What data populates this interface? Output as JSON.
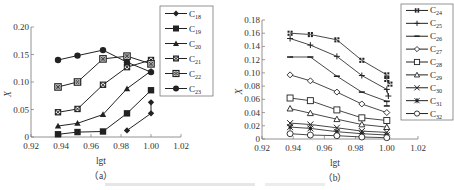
{
  "chart_data": [
    {
      "id": "a",
      "type": "line",
      "panel_label": "（a）",
      "xlabel": "lgt",
      "ylabel": "X",
      "xlim": [
        0.92,
        1.02
      ],
      "ylim": [
        0,
        0.2
      ],
      "xticks": [
        "0.92",
        "0.94",
        "0.96",
        "0.98",
        "1.00",
        "1.02"
      ],
      "yticks": [
        "0",
        "0.05",
        "0.10",
        "0.15",
        "0.20"
      ],
      "legend_position": "right",
      "series": [
        {
          "name": "C18",
          "base": "C",
          "sub": "18",
          "marker": "diamond-filled",
          "points": [
            [
              0.984,
              0.012
            ],
            [
              1.0,
              0.043
            ],
            [
              1.0,
              0.063
            ]
          ]
        },
        {
          "name": "C19",
          "base": "C",
          "sub": "19",
          "marker": "square-filled",
          "points": [
            [
              0.938,
              0.005
            ],
            [
              0.951,
              0.009
            ],
            [
              0.968,
              0.01
            ],
            [
              0.984,
              0.043
            ],
            [
              1.0,
              0.085
            ]
          ]
        },
        {
          "name": "C20",
          "base": "C",
          "sub": "20",
          "marker": "triangle-filled",
          "points": [
            [
              0.938,
              0.02
            ],
            [
              0.951,
              0.025
            ],
            [
              0.968,
              0.041
            ],
            [
              0.984,
              0.088
            ],
            [
              1.0,
              0.12
            ]
          ]
        },
        {
          "name": "C21",
          "base": "C",
          "sub": "21",
          "marker": "circle-cross",
          "points": [
            [
              0.938,
              0.045
            ],
            [
              0.951,
              0.051
            ],
            [
              0.968,
              0.095
            ],
            [
              0.984,
              0.127
            ],
            [
              1.0,
              0.14
            ]
          ]
        },
        {
          "name": "C22",
          "base": "C",
          "sub": "22",
          "marker": "square-cross",
          "points": [
            [
              0.938,
              0.091
            ],
            [
              0.951,
              0.1
            ],
            [
              0.968,
              0.142
            ],
            [
              0.984,
              0.147
            ],
            [
              1.0,
              0.133
            ]
          ]
        },
        {
          "name": "C23",
          "base": "C",
          "sub": "23",
          "marker": "circle-filled",
          "points": [
            [
              0.938,
              0.14
            ],
            [
              0.951,
              0.148
            ],
            [
              0.968,
              0.158
            ],
            [
              0.984,
              0.136
            ],
            [
              1.0,
              0.118
            ]
          ]
        }
      ]
    },
    {
      "id": "b",
      "type": "line",
      "panel_label": "（b）",
      "xlabel": "lgt",
      "ylabel": "X",
      "xlim": [
        0.92,
        1.02
      ],
      "ylim": [
        0,
        0.18
      ],
      "xticks": [
        "0.92",
        "0.94",
        "0.96",
        "0.98",
        "1.00",
        "1.02"
      ],
      "yticks": [
        "0",
        "0.02",
        "0.04",
        "0.06",
        "0.08",
        "0.10",
        "0.12",
        "0.14",
        "0.16",
        "0.18"
      ],
      "legend_position": "right",
      "series": [
        {
          "name": "C24",
          "base": "C",
          "sub": "24",
          "marker": "quad-squares",
          "points": [
            [
              0.938,
              0.16
            ],
            [
              0.951,
              0.158
            ],
            [
              0.968,
              0.15
            ],
            [
              0.984,
              0.119
            ],
            [
              1.0,
              0.097
            ],
            [
              1.0,
              0.09
            ],
            [
              1.002,
              0.083
            ]
          ]
        },
        {
          "name": "C25",
          "base": "C",
          "sub": "25",
          "marker": "plus",
          "points": [
            [
              0.938,
              0.152
            ],
            [
              0.951,
              0.142
            ],
            [
              0.968,
              0.125
            ],
            [
              0.984,
              0.096
            ],
            [
              1.0,
              0.075
            ],
            [
              1.001,
              0.065
            ]
          ]
        },
        {
          "name": "C26",
          "base": "C",
          "sub": "26",
          "marker": "dash",
          "points": [
            [
              0.938,
              0.124
            ],
            [
              0.951,
              0.124
            ],
            [
              0.968,
              0.095
            ],
            [
              0.984,
              0.071
            ],
            [
              1.0,
              0.057
            ],
            [
              1.0,
              0.05
            ]
          ]
        },
        {
          "name": "C27",
          "base": "C",
          "sub": "27",
          "marker": "diamond-open",
          "points": [
            [
              0.938,
              0.097
            ],
            [
              0.951,
              0.088
            ],
            [
              0.968,
              0.071
            ],
            [
              0.984,
              0.053
            ],
            [
              1.0,
              0.04
            ]
          ]
        },
        {
          "name": "C28",
          "base": "C",
          "sub": "28",
          "marker": "square-open",
          "points": [
            [
              0.938,
              0.062
            ],
            [
              0.951,
              0.058
            ],
            [
              0.968,
              0.044
            ],
            [
              0.984,
              0.032
            ],
            [
              1.0,
              0.028
            ]
          ]
        },
        {
          "name": "C29",
          "base": "C",
          "sub": "29",
          "marker": "triangle-open",
          "points": [
            [
              0.938,
              0.046
            ],
            [
              0.951,
              0.039
            ],
            [
              0.968,
              0.03
            ],
            [
              0.984,
              0.022
            ],
            [
              1.0,
              0.018
            ]
          ]
        },
        {
          "name": "C30",
          "base": "C",
          "sub": "30",
          "marker": "x",
          "points": [
            [
              0.938,
              0.024
            ],
            [
              0.951,
              0.022
            ],
            [
              0.968,
              0.017
            ],
            [
              0.984,
              0.012
            ],
            [
              1.0,
              0.01
            ]
          ]
        },
        {
          "name": "C31",
          "base": "C",
          "sub": "31",
          "marker": "asterisk-square",
          "points": [
            [
              0.938,
              0.018
            ],
            [
              0.951,
              0.016
            ],
            [
              0.968,
              0.011
            ],
            [
              0.984,
              0.008
            ],
            [
              1.0,
              0.006
            ]
          ]
        },
        {
          "name": "C32",
          "base": "C",
          "sub": "32",
          "marker": "circle-open",
          "points": [
            [
              0.938,
              0.008
            ],
            [
              0.951,
              0.006
            ],
            [
              0.968,
              0.005
            ],
            [
              0.984,
              0.003
            ],
            [
              1.0,
              0.002
            ]
          ]
        }
      ]
    }
  ],
  "layout": {
    "a": {
      "x0": 31,
      "x1": 181,
      "y0": 137,
      "y1": 27,
      "legend": {
        "x": 160,
        "y": 6,
        "w": 53,
        "h": 90
      }
    },
    "b": {
      "x0": 262,
      "x1": 418,
      "y0": 139,
      "y1": 20,
      "legend": {
        "x": 401,
        "y": 4,
        "w": 52,
        "h": 116
      }
    }
  }
}
